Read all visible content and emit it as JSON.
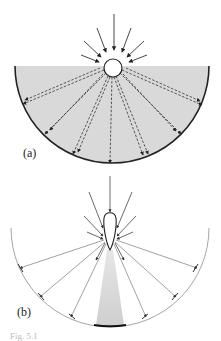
{
  "figure": {
    "panels": [
      {
        "label": "(a)",
        "description": "Circular source in semicircular shaded medium; incoming arrows converge on the circle and dashed rays radiate to the curved boundary"
      },
      {
        "label": "(b)",
        "description": "Teardrop-shaped source with incoming arrows; solid rays radiate to a thin semicircular boundary with a shaded cone below"
      }
    ],
    "caption": "Fig. 5.1"
  },
  "colors": {
    "ink": "#222222",
    "shade": "#d6d6d6",
    "thin_arc": "#9a9a9a",
    "background": "#ffffff"
  }
}
